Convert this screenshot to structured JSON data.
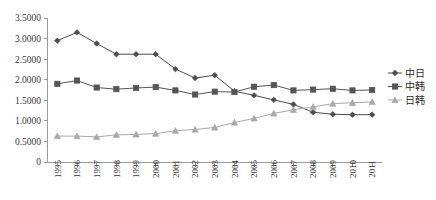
{
  "chart_data": {
    "type": "line",
    "title": "",
    "xlabel": "",
    "ylabel": "",
    "grid": false,
    "legend_position": "right",
    "ylim": [
      0,
      3.5
    ],
    "ytick_labels": [
      "0",
      "0.5000",
      "1.0000",
      "1.5000",
      "2.0000",
      "2.5000",
      "3.0000",
      "3.5000"
    ],
    "ytick_values": [
      0,
      0.5,
      1.0,
      1.5,
      2.0,
      2.5,
      3.0,
      3.5
    ],
    "categories": [
      "1995",
      "1996",
      "1997",
      "1998",
      "1999",
      "2000",
      "2001",
      "2002",
      "2003",
      "2004",
      "2005",
      "2006",
      "2007",
      "2008",
      "2009",
      "2010",
      "2011"
    ],
    "series": [
      {
        "name": "中日",
        "marker": "diamond",
        "color": "#4d4d4d",
        "values": [
          2.95,
          3.15,
          2.88,
          2.62,
          2.62,
          2.62,
          2.26,
          2.04,
          2.11,
          1.72,
          1.62,
          1.51,
          1.4,
          1.21,
          1.16,
          1.15,
          1.15
        ]
      },
      {
        "name": "中韩",
        "marker": "square",
        "color": "#555555",
        "values": [
          1.9,
          1.98,
          1.81,
          1.77,
          1.8,
          1.82,
          1.74,
          1.64,
          1.71,
          1.7,
          1.83,
          1.87,
          1.74,
          1.76,
          1.78,
          1.74,
          1.75
        ]
      },
      {
        "name": "日韩",
        "marker": "triangle",
        "color": "#a9a9a9",
        "values": [
          0.63,
          0.63,
          0.61,
          0.66,
          0.67,
          0.69,
          0.76,
          0.79,
          0.84,
          0.96,
          1.06,
          1.18,
          1.27,
          1.34,
          1.42,
          1.44,
          1.46
        ]
      }
    ]
  },
  "legend": {
    "items": [
      {
        "label": "中日"
      },
      {
        "label": "中韩"
      },
      {
        "label": "日韩"
      }
    ]
  }
}
